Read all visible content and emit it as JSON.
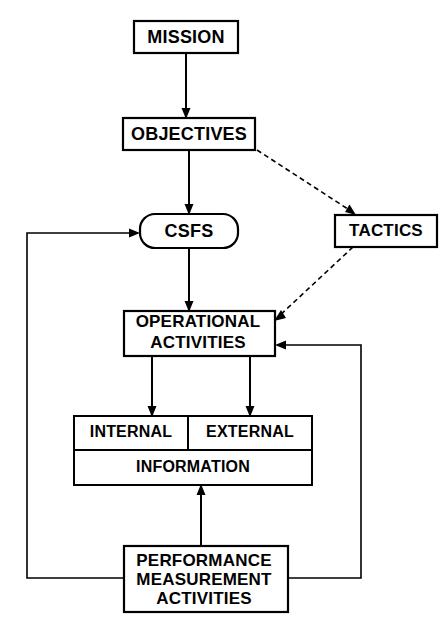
{
  "diagram": {
    "background_color": "#ffffff",
    "line_color": "#000000",
    "nodes": [
      {
        "id": "mission",
        "label": "MISSION",
        "shape": "rectangle",
        "x": 134,
        "y": 21,
        "w": 104,
        "h": 32
      },
      {
        "id": "objectives",
        "label": "OBJECTIVES",
        "shape": "rectangle",
        "x": 123,
        "y": 118,
        "w": 132,
        "h": 32
      },
      {
        "id": "csfs",
        "label": "CSFS",
        "shape": "rounded-rectangle",
        "x": 140,
        "y": 214,
        "w": 98,
        "h": 34
      },
      {
        "id": "tactics",
        "label": "TACTICS",
        "shape": "rectangle",
        "x": 335,
        "y": 215,
        "w": 102,
        "h": 32
      },
      {
        "id": "operational_activities",
        "label": "OPERATIONAL\nACTIVITIES",
        "shape": "rectangle",
        "x": 124,
        "y": 311,
        "w": 151,
        "h": 45
      },
      {
        "id": "internal",
        "label": "INTERNAL",
        "shape": "rectangle",
        "x": 74,
        "y": 416,
        "w": 114,
        "h": 34
      },
      {
        "id": "external",
        "label": "EXTERNAL",
        "shape": "rectangle",
        "x": 188,
        "y": 416,
        "w": 124,
        "h": 34
      },
      {
        "id": "information",
        "label": "INFORMATION",
        "shape": "rectangle",
        "x": 74,
        "y": 450,
        "w": 238,
        "h": 35
      },
      {
        "id": "performance_measurement_activities",
        "label": "PERFORMANCE\nMEASUREMENT\nACTIVITIES",
        "shape": "rectangle",
        "x": 124,
        "y": 546,
        "w": 164,
        "h": 66
      }
    ],
    "edges": [
      {
        "id": "mission-to-objectives",
        "from": "mission",
        "to": "objectives",
        "style": "solid",
        "arrow": "end"
      },
      {
        "id": "objectives-to-csfs",
        "from": "objectives",
        "to": "csfs",
        "style": "solid",
        "arrow": "end"
      },
      {
        "id": "objectives-to-tactics",
        "from": "objectives",
        "to": "tactics",
        "style": "dashed",
        "arrow": "end"
      },
      {
        "id": "csfs-to-operational",
        "from": "csfs",
        "to": "operational_activities",
        "style": "solid",
        "arrow": "end"
      },
      {
        "id": "tactics-to-operational",
        "from": "tactics",
        "to": "operational_activities",
        "style": "dashed",
        "arrow": "end"
      },
      {
        "id": "operational-to-internal",
        "from": "operational_activities",
        "to": "internal",
        "style": "solid",
        "arrow": "end"
      },
      {
        "id": "operational-to-external",
        "from": "operational_activities",
        "to": "external",
        "style": "solid",
        "arrow": "end"
      },
      {
        "id": "pma-to-information",
        "from": "performance_measurement_activities",
        "to": "information",
        "style": "solid",
        "arrow": "end"
      },
      {
        "id": "information-to-pma",
        "from": "information",
        "to": "performance_measurement_activities",
        "style": "solid",
        "arrow": "none"
      },
      {
        "id": "pma-feedback-to-csfs",
        "from": "performance_measurement_activities",
        "to": "csfs",
        "style": "solid",
        "arrow": "end",
        "routing": "left-loop"
      },
      {
        "id": "pma-feedback-to-operational",
        "from": "performance_measurement_activities",
        "to": "operational_activities",
        "style": "solid",
        "arrow": "end",
        "routing": "right-loop"
      }
    ]
  },
  "labels": {
    "mission": "MISSION",
    "objectives": "OBJECTIVES",
    "csfs": "CSFS",
    "tactics": "TACTICS",
    "operational_line1": "OPERATIONAL",
    "operational_line2": "ACTIVITIES",
    "internal": "INTERNAL",
    "external": "EXTERNAL",
    "information": "INFORMATION",
    "pma_line1": "PERFORMANCE",
    "pma_line2": "MEASUREMENT",
    "pma_line3": "ACTIVITIES"
  }
}
